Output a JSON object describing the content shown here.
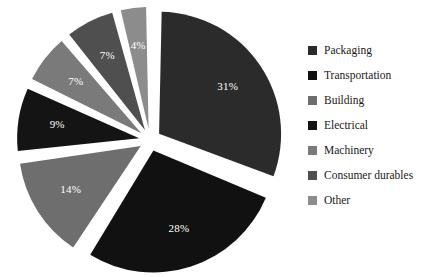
{
  "chart_data": {
    "type": "pie",
    "title": "",
    "legend_position": "right",
    "exploded": true,
    "categories": [
      "Packaging",
      "Transportation",
      "Building",
      "Electrical",
      "Machinery",
      "Consumer durables",
      "Other"
    ],
    "values": [
      31,
      28,
      14,
      9,
      7,
      7,
      4
    ],
    "labels": [
      "31%",
      "28%",
      "14%",
      "9%",
      "7%",
      "7%",
      "4%"
    ],
    "colors": [
      "#2b2b2b",
      "#111111",
      "#6e6e6e",
      "#141414",
      "#7a7a7a",
      "#4f4f4f",
      "#8c8c8c"
    ],
    "slices": [
      {
        "name": "Packaging",
        "value": 31,
        "label": "31%",
        "color": "#2b2b2b"
      },
      {
        "name": "Transportation",
        "value": 28,
        "label": "28%",
        "color": "#111111"
      },
      {
        "name": "Building",
        "value": 14,
        "label": "14%",
        "color": "#6e6e6e"
      },
      {
        "name": "Electrical",
        "value": 9,
        "label": "9%",
        "color": "#141414"
      },
      {
        "name": "Machinery",
        "value": 7,
        "label": "7%",
        "color": "#7a7a7a"
      },
      {
        "name": "Consumer durables",
        "value": 7,
        "label": "7%",
        "color": "#4f4f4f"
      },
      {
        "name": "Other",
        "value": 4,
        "label": "4%",
        "color": "#8c8c8c"
      }
    ]
  },
  "legend": {
    "items": [
      {
        "label": "Packaging",
        "color": "#2b2b2b"
      },
      {
        "label": "Transportation",
        "color": "#111111"
      },
      {
        "label": "Building",
        "color": "#6e6e6e"
      },
      {
        "label": "Electrical",
        "color": "#141414"
      },
      {
        "label": "Machinery",
        "color": "#7a7a7a"
      },
      {
        "label": "Consumer durables",
        "color": "#4f4f4f"
      },
      {
        "label": "Other",
        "color": "#8c8c8c"
      }
    ]
  }
}
